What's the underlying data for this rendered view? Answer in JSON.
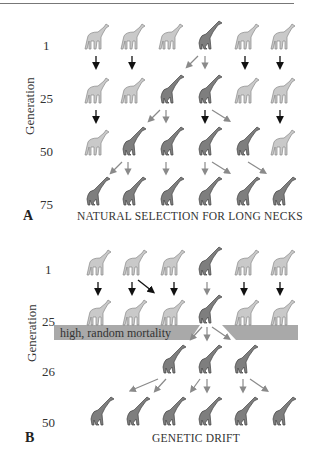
{
  "colors": {
    "light_giraffe": "#c9c9c9",
    "dark_giraffe": "#7e7e7e",
    "black_arrow": "#111111",
    "gray_arrow": "#8a8a8a",
    "mortality_band": "#a9a9a9"
  },
  "panelA": {
    "label": "A",
    "axis_label": "Generation",
    "generations": [
      "1",
      "25",
      "50",
      "75"
    ],
    "caption": "NATURAL SELECTION FOR LONG NECKS",
    "rows": [
      [
        "short",
        "short",
        "short",
        "long",
        "short",
        "short"
      ],
      [
        "short",
        "short",
        "long",
        "long",
        "short",
        "short"
      ],
      [
        "short",
        "long",
        "long",
        "long",
        "long",
        "short"
      ],
      [
        "long",
        "long",
        "long",
        "long",
        "long",
        "long"
      ]
    ]
  },
  "panelB": {
    "label": "B",
    "axis_label": "Generation",
    "generations": [
      "1",
      "25",
      "26",
      "50"
    ],
    "caption": "GENETIC DRIFT",
    "mortality_label": "high, random mortality",
    "rows": [
      [
        "short",
        "short",
        "short",
        "long",
        "short",
        "short"
      ],
      [
        "short",
        "short",
        "short",
        "long",
        "short",
        "short"
      ],
      [
        "long",
        "long",
        "long"
      ],
      [
        "long",
        "long",
        "long",
        "long",
        "long",
        "long"
      ]
    ]
  }
}
